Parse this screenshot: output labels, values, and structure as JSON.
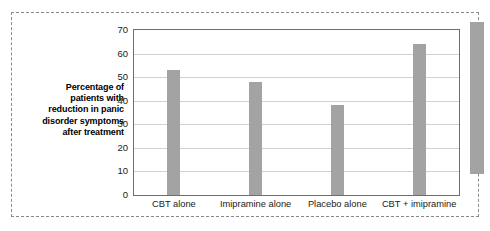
{
  "chart_data": {
    "type": "bar",
    "title": "",
    "xlabel": "",
    "ylabel": "Percentage of patients with reduction in panic disorder symptoms after treatment",
    "ylabel_lines": [
      "Percentage of",
      "patients with",
      "reduction in panic",
      "disorder symptoms",
      "after treatment"
    ],
    "categories": [
      "CBT alone",
      "Imipramine alone",
      "Placebo alone",
      "CBT + imipramine"
    ],
    "values": [
      53,
      48,
      38,
      64
    ],
    "ylim": [
      0,
      70
    ],
    "ytick_values": [
      0,
      10,
      20,
      30,
      40,
      50,
      60,
      70
    ],
    "ytick_labels": [
      "0",
      "10",
      "20",
      "30",
      "40",
      "50",
      "60",
      "70"
    ],
    "grid": true,
    "legend": null,
    "bar_color": "#a3a3a3",
    "axis_color": "#6e6e6e",
    "grid_color": "#d2d2d2"
  },
  "figure": {
    "partial_bar_note": ""
  }
}
